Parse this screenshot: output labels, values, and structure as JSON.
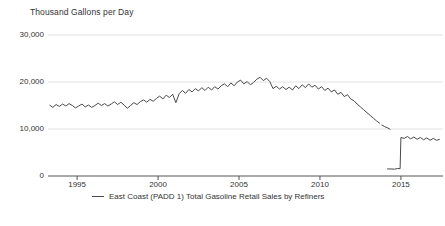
{
  "chart_data": {
    "type": "line",
    "title": "Thousand Gallons per Day",
    "xlabel": "",
    "ylabel": "Thousand Gallons per Day",
    "ylim": [
      0,
      30000
    ],
    "xlim": [
      1993.2,
      2017.6
    ],
    "yticks": [
      0,
      10000,
      20000,
      30000
    ],
    "ytick_labels": [
      "0",
      "10,000",
      "20,000",
      "30,000"
    ],
    "xticks": [
      1995,
      2000,
      2005,
      2010,
      2015
    ],
    "xtick_labels": [
      "1995",
      "2000",
      "2005",
      "2010",
      "2015"
    ],
    "grid": "horizontal",
    "legend_position": "bottom-center",
    "line_color": "#4a4a4a",
    "grid_color": "#e2e2e2",
    "axis_color": "#555555",
    "series": [
      {
        "name": "East Coast (PADD 1) Total Gasoline Retail Sales by Refiners",
        "x": [
          1993.3,
          1993.5,
          1993.7,
          1993.9,
          1994.1,
          1994.3,
          1994.5,
          1994.7,
          1994.9,
          1995.1,
          1995.3,
          1995.5,
          1995.7,
          1995.9,
          1996.1,
          1996.3,
          1996.5,
          1996.7,
          1996.9,
          1997.1,
          1997.3,
          1997.5,
          1997.7,
          1997.9,
          1998.1,
          1998.3,
          1998.5,
          1998.7,
          1998.9,
          1999.1,
          1999.3,
          1999.5,
          1999.7,
          1999.9,
          2000.1,
          2000.3,
          2000.5,
          2000.7,
          2000.9,
          2001.1,
          2001.3,
          2001.5,
          2001.7,
          2001.9,
          2002.1,
          2002.3,
          2002.5,
          2002.7,
          2002.9,
          2003.1,
          2003.3,
          2003.5,
          2003.7,
          2003.9,
          2004.1,
          2004.3,
          2004.5,
          2004.7,
          2004.9,
          2005.1,
          2005.3,
          2005.5,
          2005.7,
          2005.9,
          2006.1,
          2006.3,
          2006.5,
          2006.7,
          2006.9,
          2007.1,
          2007.3,
          2007.5,
          2007.7,
          2007.9,
          2008.1,
          2008.3,
          2008.5,
          2008.7,
          2008.9,
          2009.1,
          2009.3,
          2009.5,
          2009.7,
          2009.9,
          2010.1,
          2010.3,
          2010.5,
          2010.7,
          2010.9,
          2011.1,
          2011.3,
          2011.5,
          2011.7,
          2011.9,
          2012.1,
          2012.3,
          2012.5,
          2012.7,
          2012.9,
          2013.1,
          2013.3,
          2013.5,
          2013.7
        ],
        "values": [
          15100,
          14600,
          15200,
          14800,
          15300,
          14900,
          15400,
          15000,
          14500,
          14900,
          15300,
          14700,
          15100,
          14600,
          15000,
          15500,
          15000,
          15400,
          14900,
          15300,
          15800,
          15200,
          15700,
          15100,
          14400,
          15000,
          15600,
          15200,
          15800,
          16200,
          15700,
          16300,
          15900,
          16500,
          17000,
          16400,
          17200,
          16700,
          17400,
          15600,
          17500,
          18200,
          17600,
          18400,
          17900,
          18600,
          18100,
          18800,
          18200,
          18900,
          18300,
          19000,
          18500,
          19200,
          19600,
          19000,
          19800,
          19200,
          20000,
          20400,
          19600,
          20100,
          19400,
          19900,
          20600,
          21000,
          20300,
          20800,
          20100,
          18600,
          19100,
          18500,
          19000,
          18400,
          18900,
          18300,
          19200,
          18600,
          19400,
          18800,
          19600,
          18900,
          19300,
          18500,
          19000,
          18200,
          18700,
          17900,
          18300,
          17400,
          17800,
          16900,
          17300,
          16400,
          16000,
          15300,
          14700,
          14100,
          13500,
          12900,
          12300,
          11700,
          11200
        ],
        "segments": [
          {
            "note": "main historical series 1993-2013",
            "break_after": true
          }
        ]
      },
      {
        "name": "segment-2",
        "x": [
          2013.8,
          2014.0,
          2014.2,
          2014.35
        ],
        "values": [
          10900,
          10500,
          10200,
          9900
        ]
      },
      {
        "name": "segment-3",
        "x": [
          2014.15,
          2014.4,
          2014.6,
          2014.8,
          2014.95
        ],
        "values": [
          1500,
          1500,
          1450,
          1600,
          1550
        ]
      },
      {
        "name": "segment-4",
        "x": [
          2014.95,
          2015.0,
          2015.2,
          2015.4,
          2015.6,
          2015.8,
          2016.0,
          2016.2,
          2016.4,
          2016.6,
          2016.8,
          2017.0,
          2017.2,
          2017.4
        ],
        "values": [
          1550,
          8200,
          8000,
          8400,
          7900,
          8300,
          7800,
          8200,
          7700,
          8100,
          7600,
          8000,
          7600,
          7800
        ]
      }
    ],
    "legend_entries": [
      "East Coast (PADD 1) Total Gasoline Retail Sales by Refiners"
    ]
  }
}
